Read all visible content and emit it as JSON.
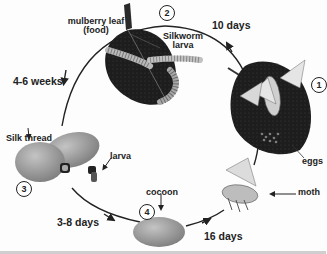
{
  "diagram": {
    "stages": [
      {
        "number": "1",
        "label": "eggs",
        "description": "Moth laying eggs on mulberry leaf"
      },
      {
        "number": "2",
        "label": "Silkworm larva",
        "description": "Larvae eating mulberry leaf (food)"
      },
      {
        "number": "3",
        "label": "Silk thread",
        "description": "Larva spinning silk thread",
        "secondary_label": "larva"
      },
      {
        "number": "4",
        "label": "cocoon",
        "description": "Cocoon"
      }
    ],
    "extra_labels": {
      "food": "mulberry leaf (food)",
      "food_line1": "mulberry leaf",
      "food_line2": "(food)",
      "larva_line1": "Silkworm",
      "larva_line2": "larva",
      "silk": "Silk thread",
      "larva_small": "larva",
      "cocoon": "cocoon",
      "moth": "moth",
      "eggs": "eggs"
    },
    "durations": [
      {
        "from": "1",
        "to": "2",
        "label": "10 days"
      },
      {
        "from": "2",
        "to": "3",
        "label": "4-6 weeks"
      },
      {
        "from": "3",
        "to": "4",
        "label": "3-8 days"
      },
      {
        "from": "4",
        "to": "1",
        "label": "16 days"
      }
    ],
    "colors": {
      "line": "#222222",
      "leaf": "#1c1c1c",
      "cocoon": "#9a9a9a",
      "background": "#fdfdfd"
    }
  }
}
